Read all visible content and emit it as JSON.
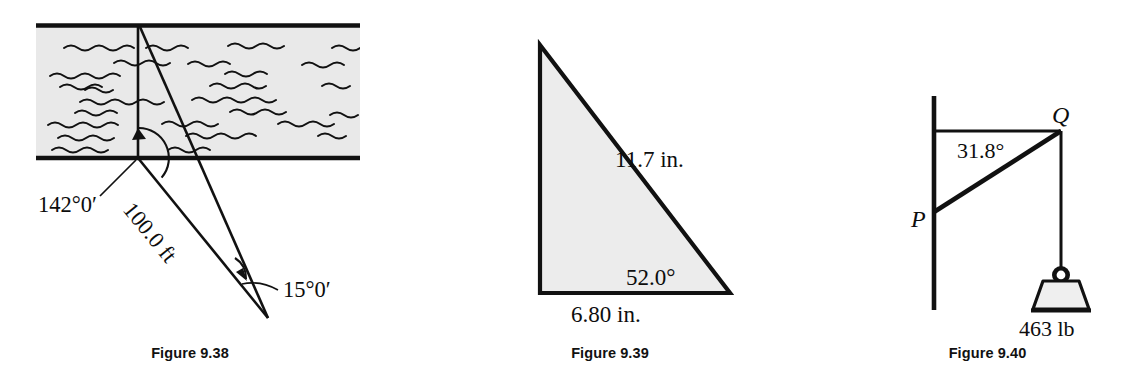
{
  "page": {
    "width": 1135,
    "height": 382,
    "background": "#ffffff",
    "ink": "#111111",
    "water_fill": "#e8e8e8",
    "shape_fill": "#ececec"
  },
  "figures": [
    {
      "id": "figure-9-38",
      "caption": "Figure 9.38",
      "description": "River with observer sighting lines across the water",
      "labels": {
        "angle_at_bank": "142°0′",
        "distance_along_line": "100.0 ft",
        "small_angle": "15°0′"
      }
    },
    {
      "id": "figure-9-39",
      "caption": "Figure 9.39",
      "description": "Shaded right triangle with labeled hypotenuse, base and angle",
      "labels": {
        "hypotenuse": "11.7 in.",
        "base": "6.80 in.",
        "angle": "52.0°"
      }
    },
    {
      "id": "figure-9-40",
      "caption": "Figure 9.40",
      "description": "Wall bracket P-Q supporting a hanging weight",
      "labels": {
        "point_upper": "Q",
        "point_lower": "P",
        "angle": "31.8°",
        "weight": "463 lb"
      }
    }
  ]
}
